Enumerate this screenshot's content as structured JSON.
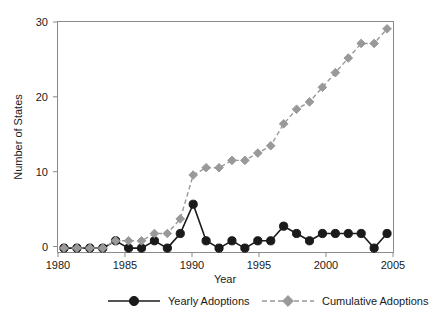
{
  "chart_data": {
    "type": "line",
    "title": "",
    "xlabel": "Year",
    "ylabel": "Number of States",
    "x": [
      1980,
      1981,
      1982,
      1983,
      1984,
      1985,
      1986,
      1987,
      1988,
      1989,
      1990,
      1991,
      1992,
      1993,
      1994,
      1995,
      1996,
      1997,
      1998,
      1999,
      2000,
      2001,
      2002,
      2003,
      2004,
      2005
    ],
    "xlim": [
      1979.5,
      2005.5
    ],
    "ylim": [
      -0.6,
      31.0
    ],
    "xticks": [
      1980,
      1985,
      1990,
      1995,
      2000,
      2005
    ],
    "xticklabels": [
      "1980",
      "1985",
      "1990",
      "1995",
      "2000",
      "2005"
    ],
    "yticks": [
      0,
      10,
      20,
      30
    ],
    "yticklabels": [
      "0",
      "10",
      "20",
      "30"
    ],
    "grid": false,
    "legend_position": "below",
    "series": [
      {
        "name": "Yearly Adoptions",
        "color": "#1a1a1a",
        "linestyle": "solid",
        "marker": "circle",
        "values": [
          0,
          0,
          0,
          0,
          1,
          0,
          0,
          1,
          0,
          2,
          6,
          1,
          0,
          1,
          0,
          1,
          1,
          3,
          2,
          1,
          2,
          2,
          2,
          2,
          0,
          2
        ]
      },
      {
        "name": "Cumulative Adoptions",
        "color": "#999999",
        "linestyle": "dashed",
        "marker": "diamond",
        "values": [
          0,
          0,
          0,
          0,
          1,
          1,
          1,
          2,
          2,
          4,
          10,
          11,
          11,
          12,
          12,
          13,
          14,
          17,
          19,
          20,
          22,
          24,
          26,
          28,
          28,
          30
        ]
      }
    ]
  },
  "legend": {
    "items": [
      {
        "label": "Yearly Adoptions"
      },
      {
        "label": "Cumulative Adoptions"
      }
    ]
  },
  "axes": {
    "x_title": "Year",
    "y_title": "Number of States"
  }
}
